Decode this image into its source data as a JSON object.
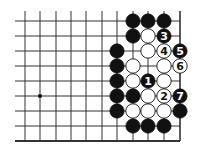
{
  "diagram": {
    "type": "go-board-fragment",
    "colors": {
      "black": "#111111",
      "white": "#ffffff",
      "line": "#333333",
      "background": "#ffffff"
    },
    "grid": {
      "columns_x": [
        25,
        40,
        56,
        71,
        86,
        102,
        117,
        133,
        148,
        164,
        180
      ],
      "rows_y": [
        21,
        36,
        51,
        66,
        81,
        96,
        111,
        126,
        141
      ],
      "h_line_start_x": 15,
      "v_line_start_y": 11,
      "right_edge_col": 10,
      "bottom_edge_row": 8
    },
    "star_points": [
      {
        "col": 1,
        "row": 5
      }
    ],
    "stones": [
      {
        "col": 7,
        "row": 0,
        "color": "black",
        "label": ""
      },
      {
        "col": 8,
        "row": 0,
        "color": "black",
        "label": ""
      },
      {
        "col": 9,
        "row": 0,
        "color": "black",
        "label": ""
      },
      {
        "col": 7,
        "row": 1,
        "color": "black",
        "label": ""
      },
      {
        "col": 8,
        "row": 1,
        "color": "white",
        "label": ""
      },
      {
        "col": 9,
        "row": 1,
        "color": "black",
        "label": "3"
      },
      {
        "col": 6,
        "row": 2,
        "color": "black",
        "label": ""
      },
      {
        "col": 8,
        "row": 2,
        "color": "white",
        "label": ""
      },
      {
        "col": 9,
        "row": 2,
        "color": "white",
        "label": "4"
      },
      {
        "col": 10,
        "row": 2,
        "color": "black",
        "label": "5"
      },
      {
        "col": 6,
        "row": 3,
        "color": "black",
        "label": ""
      },
      {
        "col": 7,
        "row": 3,
        "color": "white",
        "label": ""
      },
      {
        "col": 9,
        "row": 3,
        "color": "white",
        "label": ""
      },
      {
        "col": 10,
        "row": 3,
        "color": "white",
        "label": "6"
      },
      {
        "col": 6,
        "row": 4,
        "color": "black",
        "label": ""
      },
      {
        "col": 7,
        "row": 4,
        "color": "white",
        "label": ""
      },
      {
        "col": 8,
        "row": 4,
        "color": "black",
        "label": "1"
      },
      {
        "col": 9,
        "row": 4,
        "color": "white",
        "label": ""
      },
      {
        "col": 6,
        "row": 5,
        "color": "black",
        "label": ""
      },
      {
        "col": 7,
        "row": 5,
        "color": "black",
        "label": ""
      },
      {
        "col": 8,
        "row": 5,
        "color": "white",
        "label": ""
      },
      {
        "col": 9,
        "row": 5,
        "color": "white",
        "label": "2"
      },
      {
        "col": 10,
        "row": 5,
        "color": "black",
        "label": "7"
      },
      {
        "col": 6,
        "row": 6,
        "color": "black",
        "label": ""
      },
      {
        "col": 7,
        "row": 6,
        "color": "white",
        "label": ""
      },
      {
        "col": 8,
        "row": 6,
        "color": "white",
        "label": ""
      },
      {
        "col": 9,
        "row": 6,
        "color": "white",
        "label": ""
      },
      {
        "col": 10,
        "row": 6,
        "color": "black",
        "label": ""
      },
      {
        "col": 7,
        "row": 7,
        "color": "black",
        "label": ""
      },
      {
        "col": 8,
        "row": 7,
        "color": "black",
        "label": ""
      },
      {
        "col": 9,
        "row": 7,
        "color": "black",
        "label": ""
      }
    ]
  }
}
